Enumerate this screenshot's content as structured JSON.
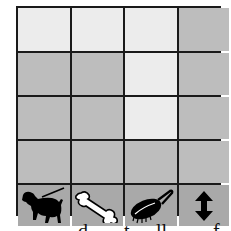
{
  "board": {
    "rows": [
      [
        "light",
        "light",
        "light",
        "dark"
      ],
      [
        "dark",
        "dark",
        "light",
        "dark"
      ],
      [
        "dark",
        "dark",
        "light",
        "dark"
      ],
      [
        "dark",
        "dark",
        "dark",
        "dark"
      ]
    ]
  },
  "toolbar": {
    "items": [
      {
        "icon": "dog-on-leash-icon"
      },
      {
        "icon": "bone-icon"
      },
      {
        "icon": "hairbrush-icon"
      },
      {
        "icon": "up-down-arrow-icon"
      }
    ]
  },
  "colors": {
    "light": "#ececec",
    "dark": "#bdbdbd",
    "tool": "#a9a9a9",
    "line": "#1a1a1a"
  }
}
